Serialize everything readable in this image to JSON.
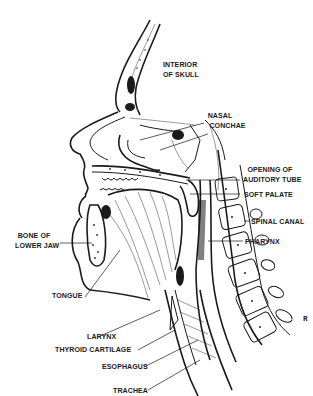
{
  "figure": {
    "background": "#ffffff",
    "ink_color": "#1a1a1a"
  },
  "labels": {
    "interior_of_skull": [
      "INTERIOR",
      "OF SKULL"
    ],
    "nasal_conchae": [
      "NASAL",
      "CONCHAE"
    ],
    "opening_of_auditory_tube": [
      "OPENING OF",
      "AUDITORY TUBE"
    ],
    "soft_palate": "SOFT PALATE",
    "spinal_canal": "SPINAL CANAL",
    "pharynx": "PHARYNX",
    "bone_of_lower_jaw": [
      "BONE OF",
      "LOWER JAW"
    ],
    "tongue": "TONGUE",
    "larynx": "LARYNX",
    "thyroid_cartilage": "THYROID CARTILAGE",
    "esophagus": "ESOPHAGUS",
    "trachea": "TRACHEA"
  },
  "stray_mark": "ʀ"
}
